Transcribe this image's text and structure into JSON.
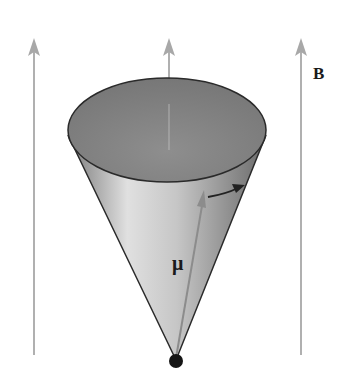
{
  "diagram": {
    "field_label": "B",
    "moment_label": "μ",
    "colors": {
      "field_arrow": "#a8a8a8",
      "cone_dark": "#6e6e6e",
      "cone_light": "#d8d8d8",
      "cap_fill": "#8a8a8a",
      "outline": "#2a2a2a",
      "moment_arrow": "#8c8c8c",
      "apex_dot": "#151515"
    },
    "field_lines": 3
  }
}
